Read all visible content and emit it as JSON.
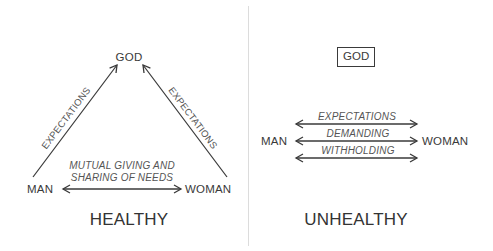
{
  "healthy": {
    "title": "HEALTHY",
    "nodes": {
      "god": "GOD",
      "man": "MAN",
      "woman": "WOMAN"
    },
    "edges": {
      "man_to_god": "EXPECTATIONS",
      "woman_to_god": "EXPECTATIONS",
      "man_woman_line1": "MUTUAL GIVING AND",
      "man_woman_line2": "SHARING OF NEEDS"
    }
  },
  "unhealthy": {
    "title": "UNHEALTHY",
    "nodes": {
      "god": "GOD",
      "man": "MAN",
      "woman": "WOMAN"
    },
    "edges": [
      {
        "label": "EXPECTATIONS"
      },
      {
        "label": "DEMANDING"
      },
      {
        "label": "WITHHOLDING"
      }
    ]
  },
  "colors": {
    "ink": "#3a3a3a",
    "divider": "#dcdcdc",
    "background": "#ffffff"
  }
}
